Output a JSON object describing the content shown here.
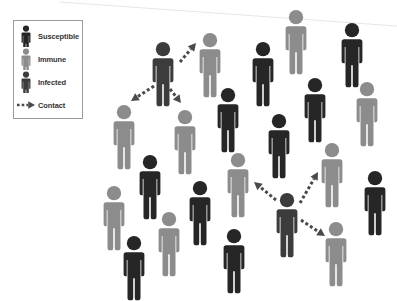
{
  "colors": {
    "susceptible": "#262626",
    "immune": "#8c8c8c",
    "infected": "#3c3c3c",
    "contact": "#4a4a4a"
  },
  "legend": {
    "items": [
      {
        "type": "susceptible",
        "label": "Susceptible",
        "icon": "person-icon"
      },
      {
        "type": "immune",
        "label": "Immune",
        "icon": "person-icon"
      },
      {
        "type": "infected",
        "label": "Infected",
        "icon": "person-icon"
      },
      {
        "type": "contact",
        "label": "Contact",
        "icon": "dashed-arrow-icon"
      }
    ]
  },
  "people": [
    {
      "type": "infected",
      "x": 163,
      "y": 42
    },
    {
      "type": "immune",
      "x": 210,
      "y": 33
    },
    {
      "type": "immune",
      "x": 296,
      "y": 10
    },
    {
      "type": "susceptible",
      "x": 352,
      "y": 23
    },
    {
      "type": "susceptible",
      "x": 263,
      "y": 42
    },
    {
      "type": "immune",
      "x": 124,
      "y": 105
    },
    {
      "type": "immune",
      "x": 185,
      "y": 110
    },
    {
      "type": "susceptible",
      "x": 228,
      "y": 88
    },
    {
      "type": "susceptible",
      "x": 315,
      "y": 78
    },
    {
      "type": "immune",
      "x": 367,
      "y": 82
    },
    {
      "type": "susceptible",
      "x": 279,
      "y": 114
    },
    {
      "type": "susceptible",
      "x": 150,
      "y": 155
    },
    {
      "type": "immune",
      "x": 238,
      "y": 153
    },
    {
      "type": "immune",
      "x": 332,
      "y": 143
    },
    {
      "type": "susceptible",
      "x": 375,
      "y": 171
    },
    {
      "type": "immune",
      "x": 114,
      "y": 186
    },
    {
      "type": "susceptible",
      "x": 200,
      "y": 181
    },
    {
      "type": "infected",
      "x": 287,
      "y": 193
    },
    {
      "type": "immune",
      "x": 169,
      "y": 212
    },
    {
      "type": "immune",
      "x": 336,
      "y": 222
    },
    {
      "type": "susceptible",
      "x": 134,
      "y": 236
    },
    {
      "type": "susceptible",
      "x": 234,
      "y": 229
    }
  ],
  "contacts": [
    {
      "from": [
        180,
        62
      ],
      "to": [
        196,
        43
      ]
    },
    {
      "from": [
        154,
        86
      ],
      "to": [
        131,
        101
      ]
    },
    {
      "from": [
        170,
        89
      ],
      "to": [
        181,
        103
      ]
    },
    {
      "from": [
        276,
        200
      ],
      "to": [
        254,
        182
      ]
    },
    {
      "from": [
        300,
        203
      ],
      "to": [
        318,
        172
      ]
    },
    {
      "from": [
        301,
        220
      ],
      "to": [
        325,
        236
      ]
    }
  ]
}
